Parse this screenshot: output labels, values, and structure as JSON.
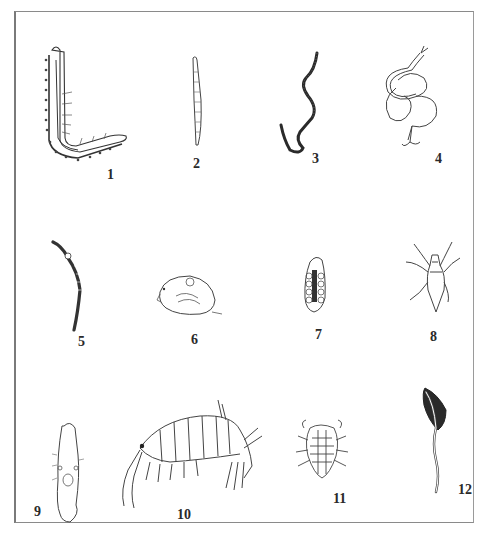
{
  "plate": {
    "figures": [
      {
        "number": "1",
        "subject": "polychaete-worm"
      },
      {
        "number": "2",
        "subject": "segmented-slender-worm"
      },
      {
        "number": "3",
        "subject": "dark-nematode"
      },
      {
        "number": "4",
        "subject": "coiled-hook-worm"
      },
      {
        "number": "5",
        "subject": "oligochaete-worm"
      },
      {
        "number": "6",
        "subject": "ostracod"
      },
      {
        "number": "7",
        "subject": "insect-larva"
      },
      {
        "number": "8",
        "subject": "water-mite"
      },
      {
        "number": "9",
        "subject": "rotifer"
      },
      {
        "number": "10",
        "subject": "amphipod"
      },
      {
        "number": "11",
        "subject": "isopod-larva"
      },
      {
        "number": "12",
        "subject": "tailed-organism"
      }
    ]
  }
}
